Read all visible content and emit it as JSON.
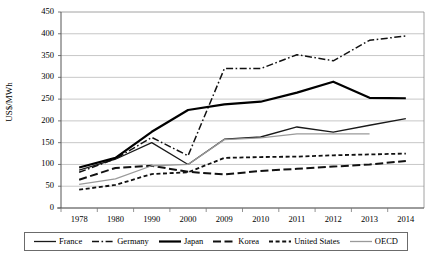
{
  "chart_data": {
    "type": "line",
    "title": "",
    "xlabel": "",
    "ylabel": "US$/MWh",
    "categories": [
      "1978",
      "1980",
      "1990",
      "2000",
      "2009",
      "2010",
      "2011",
      "2012",
      "2013",
      "2014"
    ],
    "ylim": [
      0,
      450
    ],
    "ytick_labels": [
      "0",
      "50",
      "100",
      "150",
      "200",
      "250",
      "300",
      "350",
      "400",
      "450"
    ],
    "ytick_values": [
      0,
      50,
      100,
      150,
      200,
      250,
      300,
      350,
      400,
      450
    ],
    "grid": "horizontal",
    "legend_position": "bottom",
    "series": [
      {
        "name": "France",
        "style": "solid-thin",
        "color": "#1a1a1a",
        "values": [
          87,
          112,
          150,
          100,
          158,
          163,
          186,
          174,
          190,
          205
        ]
      },
      {
        "name": "Germany",
        "style": "dash-dot",
        "color": "#111111",
        "values": [
          82,
          113,
          162,
          120,
          320,
          320,
          352,
          338,
          385,
          395
        ]
      },
      {
        "name": "Japan",
        "style": "solid-thick",
        "color": "#000000",
        "values": [
          93,
          115,
          175,
          225,
          238,
          244,
          265,
          290,
          253,
          252
        ]
      },
      {
        "name": "Korea",
        "style": "long-dash",
        "color": "#111111",
        "values": [
          65,
          92,
          97,
          83,
          77,
          85,
          90,
          95,
          100,
          108
        ]
      },
      {
        "name": "United States",
        "style": "short-dash",
        "color": "#111111",
        "values": [
          42,
          53,
          78,
          82,
          115,
          117,
          118,
          121,
          123,
          125
        ]
      },
      {
        "name": "OECD",
        "style": "solid-gray",
        "color": "#9a9a9a",
        "values": [
          54,
          67,
          97,
          100,
          157,
          161,
          170,
          170,
          170,
          null
        ]
      }
    ]
  },
  "axis": {
    "y_label": "US$/MWh"
  },
  "legend": {
    "entries": [
      {
        "label": "France"
      },
      {
        "label": "Germany"
      },
      {
        "label": "Japan"
      },
      {
        "label": "Korea"
      },
      {
        "label": "United States"
      },
      {
        "label": "OECD"
      }
    ]
  }
}
